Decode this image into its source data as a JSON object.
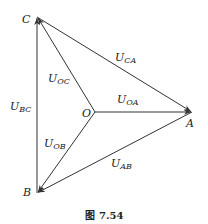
{
  "points": {
    "C": {
      "label": "C",
      "x": 37,
      "y": 17
    },
    "B": {
      "label": "B",
      "x": 37,
      "y": 193
    },
    "A": {
      "label": "A",
      "x": 192,
      "y": 112
    },
    "O": {
      "label": "O",
      "x": 95,
      "y": 112
    }
  },
  "vectors": {
    "U_BC": {
      "main": "U",
      "sub": "BC"
    },
    "U_CA": {
      "main": "U",
      "sub": "CA"
    },
    "U_AB": {
      "main": "U",
      "sub": "AB"
    },
    "U_OA": {
      "main": "U",
      "sub": "OA"
    },
    "U_OB": {
      "main": "U",
      "sub": "OB"
    },
    "U_OC": {
      "main": "U",
      "sub": "OC"
    }
  },
  "caption": {
    "prefix": "图",
    "number": "7.54"
  },
  "colors": {
    "line": "#333333",
    "text": "#222222"
  }
}
